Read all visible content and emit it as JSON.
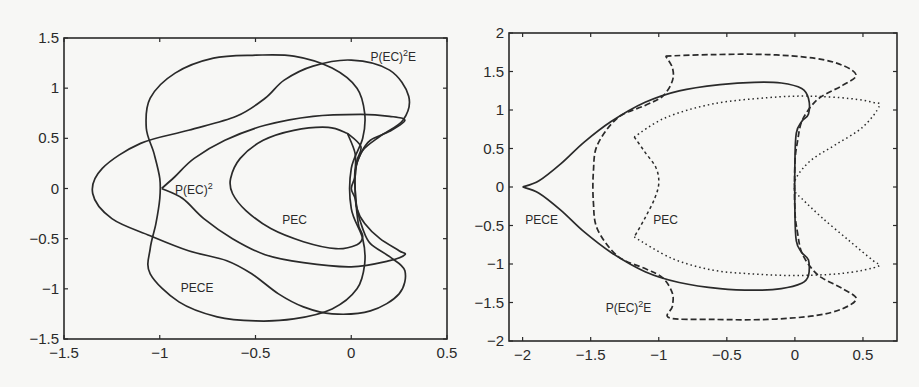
{
  "chart_data": [
    {
      "type": "line",
      "title": "",
      "xlabel": "",
      "ylabel": "",
      "xlim": [
        -1.5,
        0.5
      ],
      "ylim": [
        -1.5,
        1.5
      ],
      "xticks": [
        -1.5,
        -1,
        -0.5,
        0,
        0.5
      ],
      "yticks": [
        1.5,
        1,
        0.5,
        0,
        -0.5,
        -1,
        -1.5
      ],
      "xtick_labels": [
        "−1.5",
        "−1",
        "−0.5",
        "0",
        "0.5"
      ],
      "ytick_labels": [
        "1.5",
        "1",
        "0.5",
        "0",
        "−0.5",
        "−1",
        "−1.5"
      ],
      "grid": false,
      "legend": "none (inline labels)",
      "annotations": [
        {
          "text": "P(EC)",
          "sup": "2",
          "suffix": "E",
          "x": 0.1,
          "y": 1.27
        },
        {
          "text": "P(EC)",
          "sup": "2",
          "suffix": "",
          "x": -0.92,
          "y": -0.05
        },
        {
          "text": "PEC",
          "sup": "",
          "suffix": "",
          "x": -0.36,
          "y": -0.35
        },
        {
          "text": "PECE",
          "sup": "",
          "suffix": "",
          "x": -0.89,
          "y": -1.03
        }
      ],
      "series": [
        {
          "name": "PEC",
          "style": "solid",
          "points": [
            [
              -0.02,
              0.55
            ],
            [
              -0.12,
              0.61
            ],
            [
              -0.3,
              0.58
            ],
            [
              -0.46,
              0.48
            ],
            [
              -0.58,
              0.3
            ],
            [
              -0.63,
              0.1
            ],
            [
              -0.62,
              -0.05
            ],
            [
              -0.55,
              -0.22
            ],
            [
              -0.42,
              -0.4
            ],
            [
              -0.25,
              -0.53
            ],
            [
              -0.08,
              -0.6
            ],
            [
              0.03,
              -0.56
            ],
            [
              0.06,
              -0.48
            ],
            [
              0.04,
              -0.38
            ],
            [
              0.03,
              -0.25
            ],
            [
              0.02,
              -0.1
            ],
            [
              0.0,
              0.0
            ],
            [
              0.02,
              0.12
            ],
            [
              0.03,
              0.28
            ],
            [
              0.05,
              0.42
            ],
            [
              -0.02,
              0.55
            ]
          ]
        },
        {
          "name": "P(EC)^2",
          "style": "solid",
          "points": [
            [
              -0.99,
              0.0
            ],
            [
              -0.92,
              0.12
            ],
            [
              -0.82,
              0.3
            ],
            [
              -0.66,
              0.48
            ],
            [
              -0.45,
              0.63
            ],
            [
              -0.2,
              0.72
            ],
            [
              0.05,
              0.74
            ],
            [
              0.2,
              0.72
            ],
            [
              0.28,
              0.68
            ],
            [
              0.2,
              0.57
            ],
            [
              0.1,
              0.48
            ],
            [
              0.05,
              0.35
            ],
            [
              0.02,
              0.18
            ],
            [
              0.02,
              0.0
            ],
            [
              0.03,
              -0.2
            ],
            [
              0.07,
              -0.35
            ],
            [
              0.15,
              -0.5
            ],
            [
              0.25,
              -0.62
            ],
            [
              0.28,
              -0.66
            ],
            [
              0.2,
              -0.72
            ],
            [
              0.0,
              -0.78
            ],
            [
              -0.25,
              -0.74
            ],
            [
              -0.45,
              -0.66
            ],
            [
              -0.62,
              -0.5
            ],
            [
              -0.77,
              -0.3
            ],
            [
              -0.88,
              -0.1
            ],
            [
              -0.99,
              0.0
            ]
          ]
        },
        {
          "name": "PECE",
          "style": "solid",
          "points": [
            [
              -0.02,
              0.55
            ],
            [
              0.02,
              0.35
            ],
            [
              0.02,
              0.15
            ],
            [
              0.02,
              0.0
            ],
            [
              0.03,
              -0.2
            ],
            [
              0.06,
              -0.4
            ],
            [
              0.1,
              -0.55
            ],
            [
              0.2,
              -0.68
            ],
            [
              0.28,
              -0.82
            ],
            [
              0.25,
              -1.05
            ],
            [
              0.1,
              -1.22
            ],
            [
              -0.1,
              -1.25
            ],
            [
              -0.25,
              -1.18
            ],
            [
              -0.38,
              -1.05
            ],
            [
              -0.52,
              -0.85
            ],
            [
              -0.65,
              -0.72
            ],
            [
              -0.85,
              -0.62
            ],
            [
              -1.05,
              -0.47
            ],
            [
              -1.25,
              -0.3
            ],
            [
              -1.35,
              -0.05
            ],
            [
              -1.3,
              0.2
            ],
            [
              -1.1,
              0.45
            ],
            [
              -0.85,
              0.58
            ],
            [
              -0.6,
              0.72
            ],
            [
              -0.45,
              0.9
            ],
            [
              -0.35,
              1.08
            ],
            [
              -0.2,
              1.22
            ],
            [
              0.0,
              1.28
            ],
            [
              0.2,
              1.18
            ],
            [
              0.3,
              0.92
            ],
            [
              0.27,
              0.68
            ],
            [
              0.15,
              0.52
            ],
            [
              0.06,
              0.38
            ],
            [
              0.02,
              0.2
            ]
          ]
        },
        {
          "name": "P(EC)^2E",
          "style": "solid",
          "points": [
            [
              -0.5,
              1.33
            ],
            [
              -0.3,
              1.32
            ],
            [
              -0.1,
              1.2
            ],
            [
              0.03,
              1.0
            ],
            [
              0.07,
              0.75
            ],
            [
              0.06,
              0.5
            ],
            [
              0.0,
              0.2
            ],
            [
              0.0,
              -0.2
            ],
            [
              0.06,
              -0.5
            ],
            [
              0.07,
              -0.75
            ],
            [
              0.03,
              -1.0
            ],
            [
              -0.1,
              -1.2
            ],
            [
              -0.3,
              -1.3
            ],
            [
              -0.5,
              -1.32
            ],
            [
              -0.7,
              -1.28
            ],
            [
              -0.9,
              -1.13
            ],
            [
              -1.05,
              -0.85
            ],
            [
              -1.05,
              -0.6
            ],
            [
              -1.02,
              -0.35
            ],
            [
              -1.0,
              -0.1
            ],
            [
              -1.0,
              0.1
            ],
            [
              -1.03,
              0.35
            ],
            [
              -1.07,
              0.6
            ],
            [
              -1.05,
              0.9
            ],
            [
              -0.92,
              1.15
            ],
            [
              -0.72,
              1.3
            ],
            [
              -0.5,
              1.33
            ]
          ]
        }
      ]
    },
    {
      "type": "line",
      "title": "",
      "xlabel": "",
      "ylabel": "",
      "xlim": [
        -2.1,
        0.75
      ],
      "ylim": [
        -2,
        2
      ],
      "xticks": [
        -2,
        -1.5,
        -1,
        -0.5,
        0,
        0.5
      ],
      "yticks": [
        2,
        1.5,
        1,
        0.5,
        0,
        -0.5,
        -1,
        -1.5,
        -2
      ],
      "xtick_labels": [
        "−2",
        "−1.5",
        "−1",
        "−0.5",
        "0",
        "0.5"
      ],
      "ytick_labels": [
        "2",
        "1.5",
        "1",
        "0.5",
        "0",
        "−0.5",
        "−1",
        "−1.5",
        "−2"
      ],
      "grid": false,
      "legend": "none (inline labels)",
      "annotations": [
        {
          "text": "PECE",
          "sup": "",
          "suffix": "",
          "x": -1.98,
          "y": -0.48
        },
        {
          "text": "PEC",
          "sup": "",
          "suffix": "",
          "x": -1.04,
          "y": -0.48
        },
        {
          "text": "P(EC)",
          "sup": "2",
          "suffix": "E",
          "x": -1.39,
          "y": -1.62
        }
      ],
      "series": [
        {
          "name": "PECE",
          "style": "solid",
          "points": [
            [
              -2.0,
              0.0
            ],
            [
              -1.88,
              0.08
            ],
            [
              -1.72,
              0.3
            ],
            [
              -1.55,
              0.58
            ],
            [
              -1.35,
              0.85
            ],
            [
              -1.1,
              1.1
            ],
            [
              -0.85,
              1.25
            ],
            [
              -0.55,
              1.33
            ],
            [
              -0.3,
              1.36
            ],
            [
              -0.1,
              1.35
            ],
            [
              0.05,
              1.28
            ],
            [
              0.1,
              1.15
            ],
            [
              0.1,
              0.95
            ],
            [
              0.05,
              0.85
            ],
            [
              0.01,
              0.7
            ],
            [
              0.0,
              0.3
            ],
            [
              0.0,
              -0.3
            ],
            [
              0.01,
              -0.7
            ],
            [
              0.05,
              -0.85
            ],
            [
              0.1,
              -0.95
            ],
            [
              0.1,
              -1.15
            ],
            [
              0.05,
              -1.25
            ],
            [
              -0.1,
              -1.32
            ],
            [
              -0.3,
              -1.34
            ],
            [
              -0.55,
              -1.32
            ],
            [
              -0.85,
              -1.24
            ],
            [
              -1.1,
              -1.1
            ],
            [
              -1.35,
              -0.85
            ],
            [
              -1.55,
              -0.58
            ],
            [
              -1.72,
              -0.3
            ],
            [
              -1.88,
              -0.08
            ],
            [
              -2.0,
              0.0
            ]
          ]
        },
        {
          "name": "P(EC)^2E",
          "style": "dashed",
          "points": [
            [
              -0.95,
              1.7
            ],
            [
              -0.6,
              1.72
            ],
            [
              -0.2,
              1.72
            ],
            [
              0.15,
              1.67
            ],
            [
              0.35,
              1.58
            ],
            [
              0.45,
              1.45
            ],
            [
              0.35,
              1.32
            ],
            [
              0.2,
              1.18
            ],
            [
              0.12,
              1.05
            ],
            [
              0.05,
              0.85
            ],
            [
              0.02,
              0.6
            ],
            [
              0.0,
              0.3
            ],
            [
              0.0,
              -0.3
            ],
            [
              0.02,
              -0.6
            ],
            [
              0.05,
              -0.85
            ],
            [
              0.12,
              -1.05
            ],
            [
              0.2,
              -1.18
            ],
            [
              0.35,
              -1.32
            ],
            [
              0.45,
              -1.45
            ],
            [
              0.35,
              -1.58
            ],
            [
              0.15,
              -1.67
            ],
            [
              -0.2,
              -1.72
            ],
            [
              -0.6,
              -1.72
            ],
            [
              -0.92,
              -1.7
            ],
            [
              -0.9,
              -1.55
            ],
            [
              -0.9,
              -1.38
            ],
            [
              -0.97,
              -1.18
            ],
            [
              -1.1,
              -1.06
            ],
            [
              -1.3,
              -0.9
            ],
            [
              -1.45,
              -0.55
            ],
            [
              -1.48,
              -0.2
            ],
            [
              -1.48,
              0.2
            ],
            [
              -1.45,
              0.55
            ],
            [
              -1.3,
              0.9
            ],
            [
              -1.1,
              1.06
            ],
            [
              -0.97,
              1.18
            ],
            [
              -0.9,
              1.38
            ],
            [
              -0.9,
              1.55
            ],
            [
              -0.95,
              1.7
            ]
          ]
        },
        {
          "name": "PEC",
          "style": "dotted",
          "points": [
            [
              -1.18,
              0.65
            ],
            [
              -0.95,
              0.9
            ],
            [
              -0.6,
              1.08
            ],
            [
              -0.2,
              1.16
            ],
            [
              0.1,
              1.18
            ],
            [
              0.4,
              1.15
            ],
            [
              0.57,
              1.1
            ],
            [
              0.62,
              1.05
            ],
            [
              0.5,
              0.78
            ],
            [
              0.3,
              0.55
            ],
            [
              0.12,
              0.35
            ],
            [
              0.01,
              0.12
            ],
            [
              0.0,
              -0.05
            ],
            [
              0.05,
              -0.15
            ],
            [
              0.2,
              -0.4
            ],
            [
              0.4,
              -0.7
            ],
            [
              0.57,
              -0.95
            ],
            [
              0.62,
              -1.02
            ],
            [
              0.5,
              -1.08
            ],
            [
              0.3,
              -1.13
            ],
            [
              0.0,
              -1.15
            ],
            [
              -0.3,
              -1.13
            ],
            [
              -0.6,
              -1.08
            ],
            [
              -0.9,
              -0.93
            ],
            [
              -1.18,
              -0.65
            ]
          ]
        },
        {
          "name": "PEC-inner",
          "style": "dashdot",
          "points": [
            [
              -1.18,
              0.65
            ],
            [
              -1.1,
              0.45
            ],
            [
              -1.02,
              0.25
            ],
            [
              -1.0,
              0.05
            ],
            [
              -1.03,
              -0.15
            ],
            [
              -1.1,
              -0.4
            ],
            [
              -1.18,
              -0.65
            ]
          ]
        }
      ]
    }
  ],
  "colors": {
    "background": "#f7f7f5",
    "ink": "#2a2a2a"
  }
}
